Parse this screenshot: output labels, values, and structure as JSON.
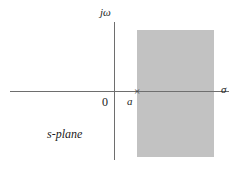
{
  "figure": {
    "plane_label": "s-plane",
    "axes": {
      "imaginary_label": "jω",
      "real_label": "σ",
      "origin_label": "0"
    },
    "pole": {
      "label": "a",
      "marker": "×"
    },
    "colors": {
      "shaded_region": "#c2c2c2",
      "axis": "#6e6e6e",
      "text": "#1c1c1c",
      "background": "#ffffff"
    }
  },
  "chart_data": {
    "type": "scatter",
    "title": "s-plane",
    "xlabel": "σ",
    "ylabel": "jω",
    "xlim": [
      -2.2,
      2.5
    ],
    "ylim": [
      -1.6,
      1.6
    ],
    "grid": false,
    "legend": null,
    "series": [
      {
        "name": "pole",
        "marker": "x",
        "x": [
          0.45
        ],
        "y": [
          0.0
        ],
        "labels": [
          "a"
        ]
      }
    ],
    "annotations": [
      {
        "text": "jω",
        "x": -0.18,
        "y": 1.55,
        "role": "imaginary-axis-label"
      },
      {
        "text": "σ",
        "x": 2.4,
        "y": -0.1,
        "role": "real-axis-label"
      },
      {
        "text": "0",
        "x": -0.22,
        "y": -0.18,
        "role": "origin-label"
      },
      {
        "text": "a",
        "x": 0.32,
        "y": -0.18,
        "role": "pole-label"
      },
      {
        "text": "s-plane",
        "x": -1.5,
        "y": -0.85,
        "role": "plane-label"
      }
    ],
    "shaded_regions": [
      {
        "name": "region-of-convergence",
        "description": "Re{s} > a",
        "x_range": [
          0.45,
          2.05
        ],
        "y_range": [
          -1.45,
          1.4
        ],
        "color": "#c2c2c2"
      }
    ]
  }
}
